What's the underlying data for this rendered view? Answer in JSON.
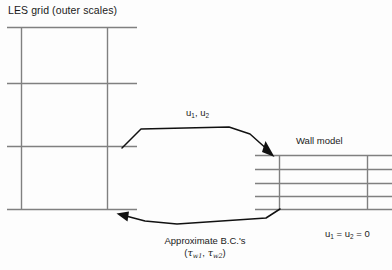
{
  "diagram": {
    "background_color": "#fdfdfd",
    "line_color": "#808080",
    "arrow_color": "#000000",
    "text_color": "#1a1a1a",
    "labels": {
      "les_grid": "LES grid (outer scales)",
      "wall_model": "Wall model",
      "velocity_inputs": "u₁, u₂",
      "velocity_inputs_parts": {
        "base": "u",
        "sub_1": "1",
        "sub_2": "2",
        "separator": ", "
      },
      "no_slip": "u₁ = u₂ = 0",
      "no_slip_parts": {
        "base": "u",
        "sub_1": "1",
        "sub_2": "2",
        "value": "0",
        "equals": " = "
      },
      "approximate_bc": "Approximate B.C.'s",
      "approximate_bc_symbols": "(τₑ₁, τₑ₂)",
      "tau_symbol": "τ",
      "tau_sub_1": "w1",
      "tau_sub_2": "w2",
      "paren_open": "(",
      "paren_close": ")",
      "comma": ", "
    },
    "les_grid": {
      "name": "LES grid (outer scales)",
      "x_range": [
        7,
        137
      ],
      "y_range": [
        27,
        209
      ],
      "horizontal_lines_y": [
        27,
        83,
        146,
        209
      ],
      "vertical_lines_x": [
        21,
        107
      ],
      "vertical_span_y": [
        27,
        209
      ],
      "horizontal_span_x": [
        7,
        137
      ]
    },
    "wall_model_grid": {
      "name": "Wall model",
      "x_range": [
        255,
        392
      ],
      "y_range": [
        155,
        210
      ],
      "horizontal_lines_y": [
        155,
        169,
        183,
        196,
        210
      ],
      "vertical_lines_x": [
        279,
        367
      ],
      "vertical_span_y": [
        155,
        210
      ],
      "horizontal_span_x": [
        255,
        392
      ]
    },
    "arrows": [
      {
        "name": "velocity-arrow",
        "direction": "les-grid-to-wall-model",
        "label": "u₁, u₂",
        "points": "122,148 141,129 229,127 248,133 272,153",
        "head_at": [
          273,
          155
        ],
        "head_angle_deg": 40
      },
      {
        "name": "wall-stress-arrow",
        "direction": "wall-model-to-les-grid",
        "label": "Approximate B.C.'s (τw1, τw2)",
        "points": "280,209 265,218 175,224 142,221 121,216",
        "head_at": [
          117,
          215
        ],
        "head_angle_deg": 196
      }
    ]
  }
}
